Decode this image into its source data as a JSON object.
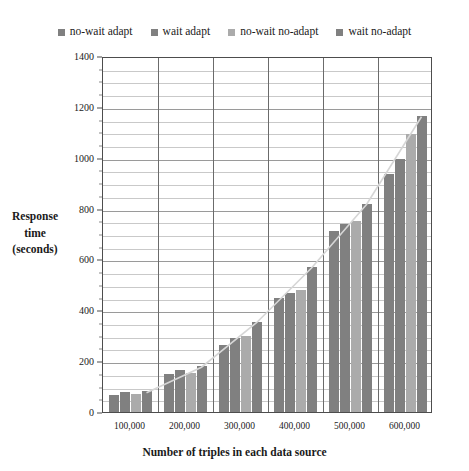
{
  "chart_data": {
    "type": "bar",
    "title": "",
    "xlabel": "Number of triples in each data source",
    "ylabel": "Response time (seconds)",
    "ylabel_lines": [
      "Response",
      "time",
      "(seconds)"
    ],
    "categories": [
      "100,000",
      "200,000",
      "300,000",
      "400,000",
      "500,000",
      "600,000"
    ],
    "ylim": [
      0,
      1400
    ],
    "yticks": [
      0,
      200,
      400,
      600,
      800,
      1000,
      1200,
      1400
    ],
    "ytick_labels": [
      "0",
      "200",
      "400",
      "600",
      "800",
      "1000",
      "1200",
      "1400"
    ],
    "minor_tick_step": 50,
    "grid": true,
    "legend_position": "top",
    "series": [
      {
        "name": "no-wait adapt",
        "color": "#808080",
        "values": [
          68,
          150,
          265,
          450,
          710,
          935
        ]
      },
      {
        "name": "wait adapt",
        "color": "#808080",
        "values": [
          80,
          165,
          290,
          470,
          740,
          995
        ]
      },
      {
        "name": "no-wait no-adapt",
        "color": "#ababab",
        "values": [
          72,
          155,
          300,
          480,
          750,
          1095
        ]
      },
      {
        "name": "wait no-adapt",
        "color": "#808080",
        "values": [
          82,
          180,
          355,
          570,
          820,
          1165
        ]
      }
    ],
    "trendline": {
      "visible": true,
      "color": "#d6d6d6",
      "values": [
        80,
        180,
        355,
        570,
        820,
        1165
      ]
    }
  }
}
